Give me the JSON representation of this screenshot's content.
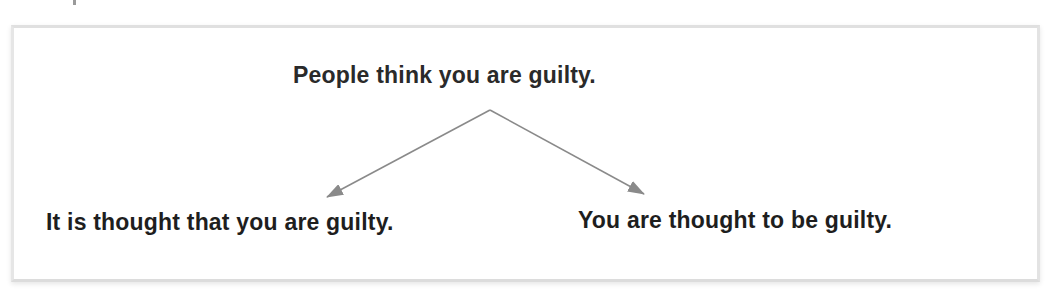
{
  "diagram": {
    "source": {
      "text": "People think you are guilty."
    },
    "transformations": [
      {
        "text": "It is thought that you are guilty."
      },
      {
        "text": "You are thought to be guilty."
      }
    ],
    "arrows": {
      "color": "#8a8a8a",
      "apex": [
        490,
        110
      ],
      "left_tip": [
        327,
        197
      ],
      "right_tip": [
        644,
        194
      ]
    }
  }
}
